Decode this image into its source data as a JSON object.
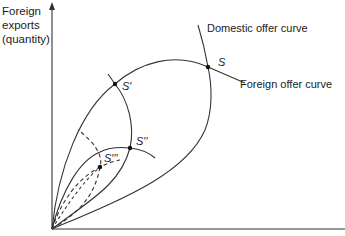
{
  "diagram": {
    "axes": {
      "y_label_lines": [
        "Foreign",
        "exports",
        "(quantity)"
      ],
      "x_label": ""
    },
    "curve_labels": {
      "domestic": "Domestic offer curve",
      "foreign": "Foreign offer curve"
    },
    "points": {
      "s": "S",
      "s1": "S′",
      "s2": "S′′",
      "s3": "S′′′"
    },
    "colors": {
      "line": "#333333",
      "background": "#ffffff"
    }
  }
}
